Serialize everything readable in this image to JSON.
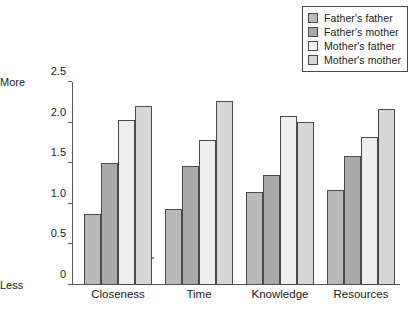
{
  "chart_data": {
    "type": "bar",
    "title": "",
    "subtitle": "",
    "xlabel": "",
    "ylabel": "",
    "ylim": [
      0,
      2.5
    ],
    "grid": false,
    "legend_position": "top-right",
    "categories": [
      "Closeness",
      "Time",
      "Knowledge",
      "Resources"
    ],
    "y_ticks": [
      "0",
      "0.5",
      "1.0",
      "1.5",
      "2.0",
      "2.5"
    ],
    "y_tick_values": [
      0,
      0.5,
      1.0,
      1.5,
      2.0,
      2.5
    ],
    "axis_endcap_high": "More",
    "axis_endcap_low": "Less",
    "series": [
      {
        "name": "Father's father",
        "color": "#b9b9b9",
        "values": [
          0.88,
          0.93,
          1.15,
          1.17
        ]
      },
      {
        "name": "Father's mother",
        "color": "#a9a9a9",
        "values": [
          1.5,
          1.47,
          1.35,
          1.59
        ]
      },
      {
        "name": "Mother's father",
        "color": "#efefef",
        "values": [
          2.03,
          1.78,
          2.08,
          1.82
        ]
      },
      {
        "name": "Mother's mother",
        "color": "#d6d6d6",
        "values": [
          2.2,
          2.27,
          2.01,
          2.17
        ]
      }
    ]
  },
  "legend": {
    "items": [
      {
        "label": "Father's father"
      },
      {
        "label": "Father's mother"
      },
      {
        "label": "Mother's father"
      },
      {
        "label": "Mother's mother"
      }
    ]
  }
}
